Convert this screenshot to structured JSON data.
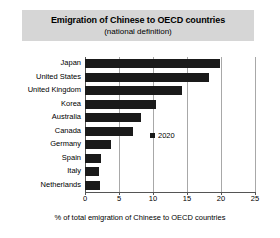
{
  "title": {
    "main": "Emigration of Chinese to OECD countries",
    "sub": "(national definition)"
  },
  "legend": {
    "label": "2020",
    "marker": "square-marker",
    "color": "#1a1a1a"
  },
  "axis": {
    "xlabel": "% of total emigration of Chinese to OECD countries",
    "ticks": [
      "0",
      "5",
      "10",
      "15",
      "20",
      "25"
    ]
  },
  "colors": {
    "bar": "#1a1a1a",
    "grid": "#a8a8a8",
    "axis": "#555555",
    "title_banner": "#d6d6d6",
    "background": "#ffffff"
  },
  "chart_data": {
    "type": "bar",
    "orientation": "horizontal",
    "title": "Emigration of Chinese to OECD countries (national definition)",
    "xlabel": "% of total emigration of Chinese to OECD countries",
    "ylabel": "",
    "xlim": [
      0,
      25
    ],
    "xticks": [
      0,
      5,
      10,
      15,
      20,
      25
    ],
    "grid": true,
    "legend_position": "inside-center-right",
    "categories": [
      "Japan",
      "United States",
      "United Kingdom",
      "Korea",
      "Australia",
      "Canada",
      "Germany",
      "Spain",
      "Italy",
      "Netherlands"
    ],
    "series": [
      {
        "name": "2020",
        "values": [
          19.9,
          18.2,
          14.2,
          10.5,
          8.2,
          7.0,
          3.8,
          2.4,
          2.1,
          2.2
        ]
      }
    ]
  }
}
